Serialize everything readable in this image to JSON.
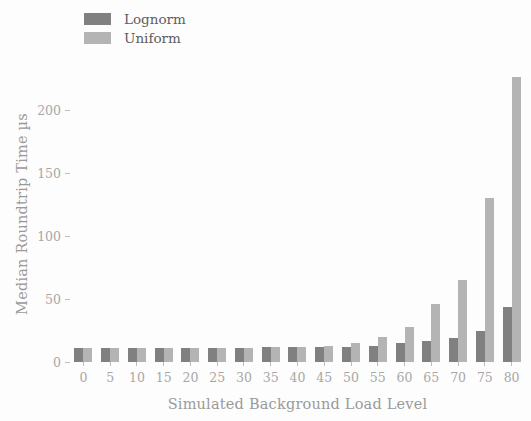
{
  "chart_data": {
    "type": "bar",
    "title": "",
    "xlabel": "Simulated Background Load Level",
    "ylabel": "Median Roundtrip Time µs",
    "categories": [
      "0",
      "5",
      "10",
      "15",
      "20",
      "25",
      "30",
      "35",
      "40",
      "45",
      "50",
      "55",
      "60",
      "65",
      "70",
      "75",
      "80"
    ],
    "yticks": [
      "0",
      "50",
      "100",
      "150",
      "200"
    ],
    "ytick_values": [
      0,
      50,
      100,
      150,
      200
    ],
    "ylim": [
      0,
      235
    ],
    "grid": false,
    "legend_position": "upper left",
    "series": [
      {
        "name": "Lognorm",
        "color": "#808080",
        "values": [
          11,
          11,
          11,
          11,
          11,
          11,
          11,
          12,
          12,
          12,
          12,
          13,
          15,
          17,
          19,
          25,
          44
        ]
      },
      {
        "name": "Uniform",
        "color": "#b4b4b4",
        "values": [
          11,
          11,
          11,
          11,
          11,
          11,
          11,
          12,
          12,
          13,
          15,
          20,
          28,
          46,
          65,
          130,
          226
        ]
      }
    ]
  },
  "legend": {
    "items": [
      {
        "label": "Lognorm",
        "color": "#808080"
      },
      {
        "label": "Uniform",
        "color": "#b4b4b4"
      }
    ]
  },
  "axes": {
    "x_title": "Simulated Background Load Level",
    "y_title": "Median Roundtrip Time µs"
  }
}
